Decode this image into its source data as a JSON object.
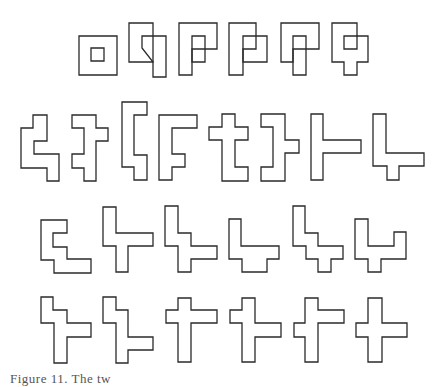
{
  "figure": {
    "stroke_color": "#2a2a2a",
    "background": "#ffffff",
    "rows": [
      {
        "name": "row-1",
        "shapes": [
          {
            "polys": [
              "79,36 117,36 117,75 79,75",
              "91,48 104,48 104,61 91,61"
            ]
          },
          {
            "polys": [
              "129,23 153,23 153,62 129,62",
              "142,48 142,36 166,36 166,77 153,77 153,62"
            ]
          },
          {
            "polys": [
              "179,23 217,23 217,49 192,49 192,75 179,75",
              "192,36 205,36 205,62 192,62"
            ]
          },
          {
            "polys": [
              "229,23 256,23 256,49 243,49 243,75 229,75",
              "243,36 267,36 267,62 243,62"
            ]
          },
          {
            "polys": [
              "281,23 319,23 319,49 293,49 293,62 281,62",
              "293,36 306,36 306,75 293,75 293,62"
            ]
          },
          {
            "polys": [
              "332,23 357,23 357,36 368,36 368,62 357,62 357,75 344,75 344,62 332,62",
              "344,36 357,36 357,49 344,49"
            ]
          }
        ]
      },
      {
        "name": "row-2",
        "shapes": [
          {
            "polys": [
              "33,115 47,115 47,141 34,141 34,154 59,154 59,181 47,181 47,168 21,168 21,128 33,128"
            ]
          },
          {
            "polys": [
              "72,115 96,115 96,128 108,128 108,141 96,141 96,181 84,181 84,168 72,168 72,154 84,154 84,128 72,128"
            ]
          },
          {
            "polys": [
              "122,102 147,102 147,115 134,115 134,155 147,155 147,180 134,180 134,167 122,167"
            ]
          },
          {
            "polys": [
              "159,115 197,115 197,128 172,128 172,154 185,154 185,167 172,167 172,180 159,180"
            ]
          },
          {
            "polys": [
              "222,114 235,114 235,127 248,127 248,140 235,140 235,167 248,167 248,181 222,181 222,140 209,140 209,127 222,127"
            ]
          },
          {
            "polys": [
              "261,114 285,114 285,140 299,140 299,153 285,153 285,181 261,181 261,167 273,167 273,127 261,127"
            ]
          },
          {
            "polys": [
              "311,114 323,114 323,140 361,140 361,153 323,153 323,180 311,180"
            ]
          },
          {
            "polys": [
              "373,114 386,114 386,153 424,153 424,166 399,166 399,180 387,180 387,166 373,166"
            ]
          }
        ]
      },
      {
        "name": "row-3",
        "shapes": [
          {
            "polys": [
              "41,220 67,220 67,233 53,233 53,247 67,247 67,259 91,259 91,273 54,273 54,260 41,260"
            ]
          },
          {
            "polys": [
              "103,207 116,207 116,233 153,233 153,246 128,246 128,272 116,272 116,246 103,246"
            ]
          },
          {
            "polys": [
              "165,206 178,206 178,233 191,233 191,246 217,246 217,259 191,259 191,272 178,272 178,246 165,246"
            ]
          },
          {
            "polys": [
              "229,219 241,219 241,246 279,246 279,259 267,259 267,272 242,272 242,259 229,259"
            ]
          },
          {
            "polys": [
              "293,206 305,206 305,233 318,233 318,246 343,246 343,259 331,259 331,272 318,272 318,259 306,259 306,246 293,246"
            ]
          },
          {
            "polys": [
              "355,219 368,219 368,246 394,246 394,232 406,232 406,259 381,259 381,272 368,272 368,259 355,259"
            ]
          }
        ]
      },
      {
        "name": "row-4",
        "shapes": [
          {
            "polys": [
              "41,297 53,297 53,310 67,310 67,323 91,323 91,337 67,337 67,363 54,363 54,323 41,323"
            ]
          },
          {
            "polys": [
              "103,297 116,297 116,310 128,310 128,337 153,337 153,350 128,350 128,363 116,363 116,323 103,323"
            ]
          },
          {
            "polys": [
              "178,298 191,298 191,310 217,310 217,323 191,323 191,362 178,362 178,323 166,323 166,310 178,310"
            ]
          },
          {
            "polys": [
              "242,298 255,298 255,323 281,323 281,337 255,337 255,362 242,362 242,323 230,323 230,310 242,310"
            ]
          },
          {
            "polys": [
              "305,298 318,298 318,310 344,310 344,323 318,323 318,362 305,362 305,337 294,337 294,323 305,323"
            ]
          },
          {
            "polys": [
              "368,298 382,298 382,323 407,323 407,337 382,337 382,362 368,362 368,337 356,337 356,323 368,323"
            ]
          }
        ]
      }
    ]
  },
  "caption": {
    "text": "Figure 11. The tw              "
  }
}
